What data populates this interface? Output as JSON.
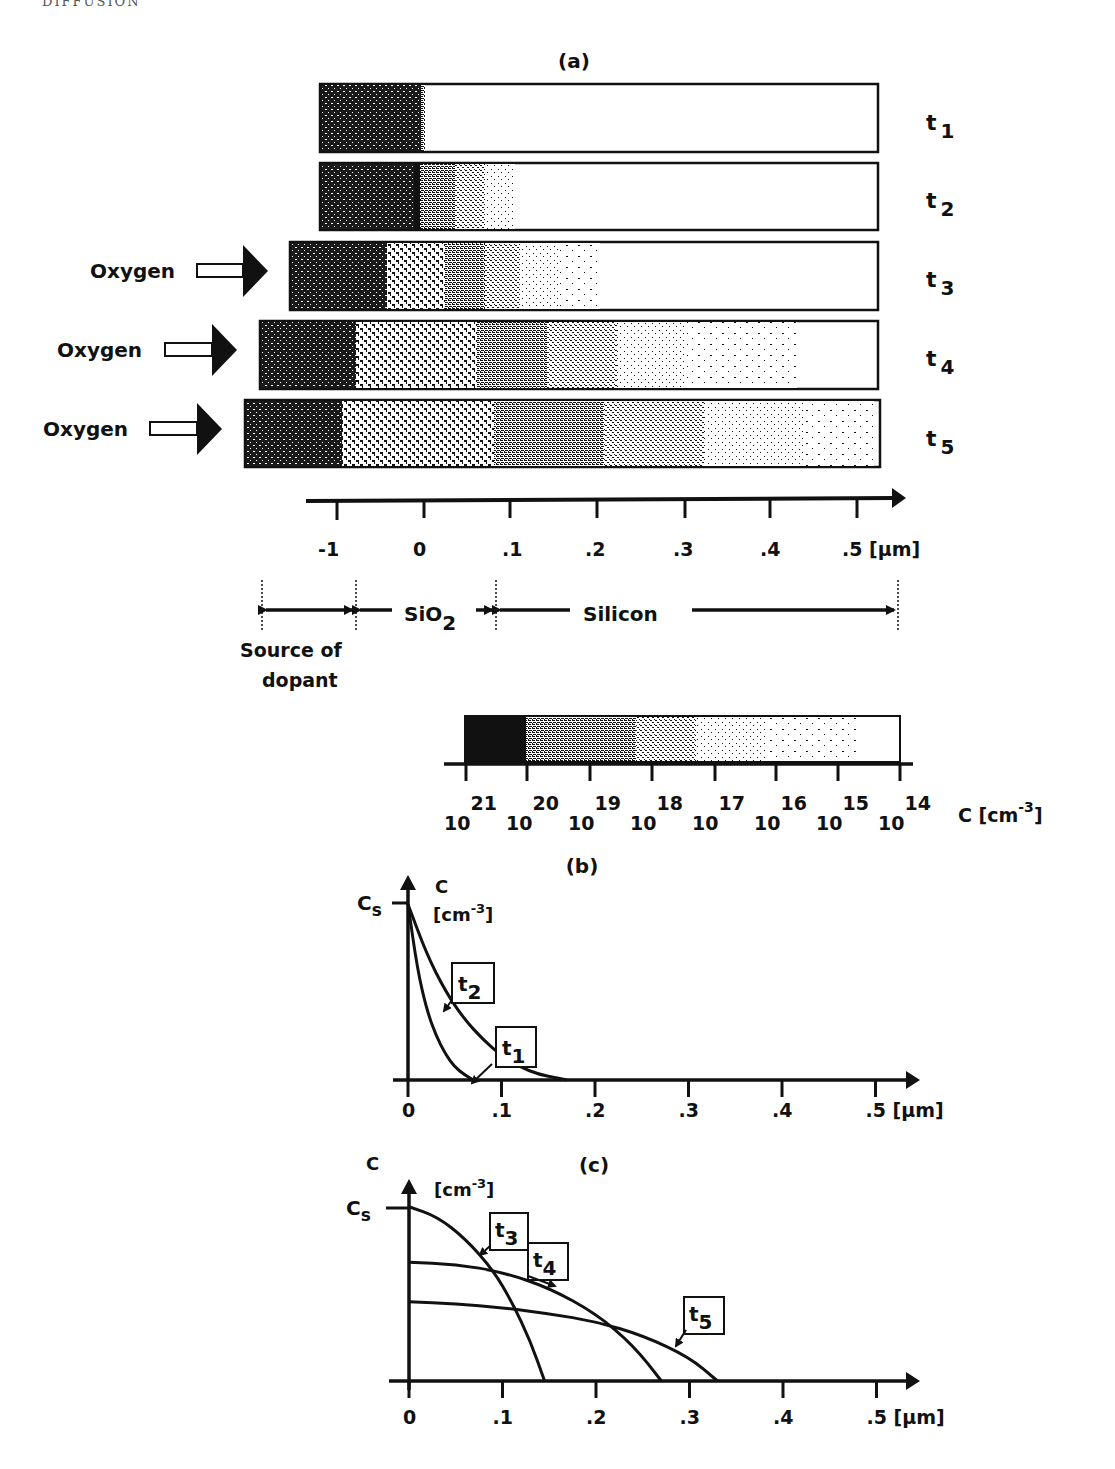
{
  "page": {
    "running_header": "DIFFUSION"
  },
  "panel_a": {
    "label": "(a)",
    "bars": [
      {
        "id": "t1",
        "time_label": "t",
        "time_sub": "1",
        "oxygen": false,
        "oxygen_label": ""
      },
      {
        "id": "t2",
        "time_label": "t",
        "time_sub": "2",
        "oxygen": false,
        "oxygen_label": ""
      },
      {
        "id": "t3",
        "time_label": "t",
        "time_sub": "3",
        "oxygen": true,
        "oxygen_label": "Oxygen"
      },
      {
        "id": "t4",
        "time_label": "t",
        "time_sub": "4",
        "oxygen": true,
        "oxygen_label": "Oxygen"
      },
      {
        "id": "t5",
        "time_label": "t",
        "time_sub": "5",
        "oxygen": true,
        "oxygen_label": "Oxygen"
      }
    ],
    "axis": {
      "ticks": [
        "-1",
        "0",
        ".1",
        ".2",
        ".3",
        ".4",
        ".5 [µm]"
      ]
    },
    "regions": {
      "source": "Source of",
      "source_line2": "dopant",
      "oxide": "SiO",
      "oxide_sub": "2",
      "silicon": "Silicon"
    },
    "scale_bar": {
      "ticks": [
        {
          "base": "10",
          "exp": "21"
        },
        {
          "base": "10",
          "exp": "20"
        },
        {
          "base": "10",
          "exp": "19"
        },
        {
          "base": "10",
          "exp": "18"
        },
        {
          "base": "10",
          "exp": "17"
        },
        {
          "base": "10",
          "exp": "16"
        },
        {
          "base": "10",
          "exp": "15"
        },
        {
          "base": "10",
          "exp": "14"
        }
      ],
      "unit_label": "C [cm",
      "unit_exp": "-3",
      "unit_close": "]"
    }
  },
  "chart_data": [
    {
      "type": "line",
      "title": "(b)",
      "xlabel": "[µm]",
      "ylabel": "C [cm^-3]",
      "y_marker": "Cs",
      "x_ticks": [
        "0",
        ".1",
        ".2",
        ".3",
        ".4",
        ".5"
      ],
      "xlim": [
        0,
        0.55
      ],
      "ylim": [
        0,
        1.0
      ],
      "series": [
        {
          "name": "t1",
          "x": [
            0,
            0.01,
            0.02,
            0.03,
            0.04,
            0.05,
            0.06,
            0.07
          ],
          "y": [
            0.95,
            0.6,
            0.38,
            0.24,
            0.14,
            0.07,
            0.03,
            0.0
          ]
        },
        {
          "name": "t2",
          "x": [
            0,
            0.02,
            0.04,
            0.06,
            0.08,
            0.1,
            0.12,
            0.14,
            0.16,
            0.17
          ],
          "y": [
            0.95,
            0.68,
            0.48,
            0.33,
            0.22,
            0.13,
            0.07,
            0.03,
            0.01,
            0.0
          ]
        }
      ]
    },
    {
      "type": "line",
      "title": "(c)",
      "xlabel": "[µm]",
      "ylabel": "C [cm^-3]",
      "y_marker": "Cs",
      "x_ticks": [
        "0",
        ".1",
        ".2",
        ".3",
        ".4",
        ".5"
      ],
      "xlim": [
        0,
        0.55
      ],
      "ylim": [
        0,
        1.0
      ],
      "series": [
        {
          "name": "t3",
          "x": [
            0,
            0.03,
            0.06,
            0.09,
            0.11,
            0.13,
            0.145
          ],
          "y": [
            0.88,
            0.83,
            0.72,
            0.56,
            0.4,
            0.2,
            0.0
          ]
        },
        {
          "name": "t4",
          "x": [
            0,
            0.05,
            0.1,
            0.15,
            0.2,
            0.24,
            0.27
          ],
          "y": [
            0.6,
            0.59,
            0.55,
            0.47,
            0.34,
            0.18,
            0.0
          ]
        },
        {
          "name": "t5",
          "x": [
            0,
            0.05,
            0.1,
            0.15,
            0.2,
            0.25,
            0.3,
            0.33
          ],
          "y": [
            0.4,
            0.39,
            0.37,
            0.34,
            0.3,
            0.23,
            0.12,
            0.0
          ]
        }
      ]
    }
  ]
}
